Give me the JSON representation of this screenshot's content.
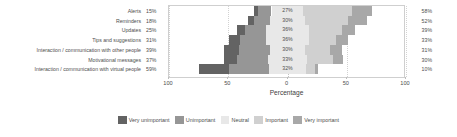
{
  "chart_data": {
    "type": "bar",
    "subtype": "diverging-stacked-likert",
    "title": "",
    "xlabel": "Percentage",
    "ylabel": "",
    "xlim": [
      -100,
      100
    ],
    "xticks": [
      "100",
      "50",
      "0",
      "50",
      "100"
    ],
    "xtick_values": [
      -100,
      -50,
      0,
      50,
      100
    ],
    "grid": true,
    "legend_position": "bottom",
    "categories": [
      "Alerts",
      "Reminders",
      "Updates",
      "Tips and suggestions",
      "Interaction / communication with other people",
      "Motivational messages",
      "Interaction / communication with virtual people"
    ],
    "series": [
      {
        "name": "Very unimportant",
        "color": "#636363",
        "values": [
          4,
          5,
          7,
          9,
          13,
          11,
          26
        ]
      },
      {
        "name": "Unimportant",
        "color": "#969696",
        "values": [
          11,
          13,
          18,
          22,
          26,
          26,
          33
        ]
      },
      {
        "name": "Neutral",
        "color": "#e8e8e8",
        "values": [
          27,
          30,
          36,
          36,
          30,
          33,
          32
        ]
      },
      {
        "name": "Important",
        "color": "#d0d0d0",
        "values": [
          41,
          36,
          28,
          23,
          21,
          22,
          7
        ]
      },
      {
        "name": "Very important",
        "color": "#a8a8a8",
        "values": [
          17,
          16,
          11,
          10,
          10,
          8,
          3
        ]
      }
    ],
    "negative_totals": [
      "15%",
      "18%",
      "25%",
      "31%",
      "39%",
      "37%",
      "59%"
    ],
    "neutral_labels": [
      "27%",
      "30%",
      "36%",
      "36%",
      "30%",
      "33%",
      "32%"
    ],
    "positive_totals": [
      "58%",
      "52%",
      "39%",
      "33%",
      "31%",
      "30%",
      "10%"
    ],
    "legend": [
      {
        "label": "Very unimportant",
        "color": "#636363"
      },
      {
        "label": "Unimportant",
        "color": "#969696"
      },
      {
        "label": "Neutral",
        "color": "#e8e8e8"
      },
      {
        "label": "Important",
        "color": "#d0d0d0"
      },
      {
        "label": "Very important",
        "color": "#a8a8a8"
      }
    ]
  }
}
